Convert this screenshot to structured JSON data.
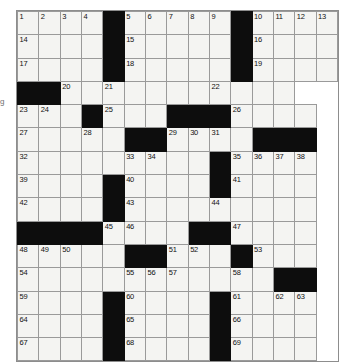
{
  "puzzle": {
    "title": "Crossword Grid",
    "rows": 14,
    "cols": 13,
    "cell_fill_color": "#f4f4f2",
    "block_color": "#0d0d0d",
    "grid_line_color": "#9a9a9a",
    "number_color": "#111111",
    "margin_artifact": "g",
    "grid": [
      [
        {
          "n": "1",
          "b": false
        },
        {
          "n": "2",
          "b": false
        },
        {
          "n": "3",
          "b": false
        },
        {
          "n": "4",
          "b": false
        },
        {
          "n": "",
          "b": true
        },
        {
          "n": "5",
          "b": false
        },
        {
          "n": "6",
          "b": false
        },
        {
          "n": "7",
          "b": false
        },
        {
          "n": "8",
          "b": false
        },
        {
          "n": "9",
          "b": false
        },
        {
          "n": "",
          "b": true
        },
        {
          "n": "10",
          "b": false
        },
        {
          "n": "11",
          "b": false
        },
        {
          "n": "12",
          "b": false
        },
        {
          "n": "13",
          "b": false
        }
      ],
      [
        {
          "n": "14",
          "b": false
        },
        {
          "n": "",
          "b": false
        },
        {
          "n": "",
          "b": false
        },
        {
          "n": "",
          "b": false
        },
        {
          "n": "",
          "b": true
        },
        {
          "n": "15",
          "b": false
        },
        {
          "n": "",
          "b": false
        },
        {
          "n": "",
          "b": false
        },
        {
          "n": "",
          "b": false
        },
        {
          "n": "",
          "b": false
        },
        {
          "n": "",
          "b": true
        },
        {
          "n": "16",
          "b": false
        },
        {
          "n": "",
          "b": false
        },
        {
          "n": "",
          "b": false
        },
        {
          "n": "",
          "b": false
        }
      ],
      [
        {
          "n": "17",
          "b": false
        },
        {
          "n": "",
          "b": false
        },
        {
          "n": "",
          "b": false
        },
        {
          "n": "",
          "b": false
        },
        {
          "n": "",
          "b": true
        },
        {
          "n": "18",
          "b": false
        },
        {
          "n": "",
          "b": false
        },
        {
          "n": "",
          "b": false
        },
        {
          "n": "",
          "b": false
        },
        {
          "n": "",
          "b": false
        },
        {
          "n": "",
          "b": true
        },
        {
          "n": "19",
          "b": false
        },
        {
          "n": "",
          "b": false
        },
        {
          "n": "",
          "b": false
        },
        {
          "n": "",
          "b": false
        }
      ],
      [
        {
          "n": "",
          "b": true
        },
        {
          "n": "",
          "b": true
        },
        {
          "n": "20",
          "b": false
        },
        {
          "n": "",
          "b": false
        },
        {
          "n": "21",
          "b": false
        },
        {
          "n": "",
          "b": false
        },
        {
          "n": "",
          "b": false
        },
        {
          "n": "",
          "b": false
        },
        {
          "n": "",
          "b": false
        },
        {
          "n": "22",
          "b": false
        },
        {
          "n": "",
          "b": false
        },
        {
          "n": "",
          "b": false
        },
        {
          "n": "",
          "b": false
        }
      ],
      [
        {
          "n": "23",
          "b": false
        },
        {
          "n": "24",
          "b": false
        },
        {
          "n": "",
          "b": false
        },
        {
          "n": "",
          "b": true
        },
        {
          "n": "25",
          "b": false
        },
        {
          "n": "",
          "b": false
        },
        {
          "n": "",
          "b": false
        },
        {
          "n": "",
          "b": true
        },
        {
          "n": "",
          "b": true
        },
        {
          "n": "",
          "b": true
        },
        {
          "n": "26",
          "b": false
        },
        {
          "n": "",
          "b": false
        },
        {
          "n": "",
          "b": false
        },
        {
          "n": "",
          "b": false
        }
      ],
      [
        {
          "n": "27",
          "b": false
        },
        {
          "n": "",
          "b": false
        },
        {
          "n": "",
          "b": false
        },
        {
          "n": "28",
          "b": false
        },
        {
          "n": "",
          "b": false
        },
        {
          "n": "",
          "b": true
        },
        {
          "n": "",
          "b": true
        },
        {
          "n": "29",
          "b": false
        },
        {
          "n": "30",
          "b": false
        },
        {
          "n": "31",
          "b": false
        },
        {
          "n": "",
          "b": false
        },
        {
          "n": "",
          "b": true
        },
        {
          "n": "",
          "b": true
        },
        {
          "n": "",
          "b": true
        }
      ],
      [
        {
          "n": "32",
          "b": false
        },
        {
          "n": "",
          "b": false
        },
        {
          "n": "",
          "b": false
        },
        {
          "n": "",
          "b": false
        },
        {
          "n": "",
          "b": false
        },
        {
          "n": "33",
          "b": false
        },
        {
          "n": "34",
          "b": false
        },
        {
          "n": "",
          "b": false
        },
        {
          "n": "",
          "b": false
        },
        {
          "n": "",
          "b": true
        },
        {
          "n": "35",
          "b": false
        },
        {
          "n": "36",
          "b": false
        },
        {
          "n": "37",
          "b": false
        },
        {
          "n": "38",
          "b": false
        }
      ],
      [
        {
          "n": "39",
          "b": false
        },
        {
          "n": "",
          "b": false
        },
        {
          "n": "",
          "b": false
        },
        {
          "n": "",
          "b": false
        },
        {
          "n": "",
          "b": true
        },
        {
          "n": "40",
          "b": false
        },
        {
          "n": "",
          "b": false
        },
        {
          "n": "",
          "b": false
        },
        {
          "n": "",
          "b": false
        },
        {
          "n": "",
          "b": true
        },
        {
          "n": "41",
          "b": false
        },
        {
          "n": "",
          "b": false
        },
        {
          "n": "",
          "b": false
        },
        {
          "n": "",
          "b": false
        }
      ],
      [
        {
          "n": "42",
          "b": false
        },
        {
          "n": "",
          "b": false
        },
        {
          "n": "",
          "b": false
        },
        {
          "n": "",
          "b": false
        },
        {
          "n": "",
          "b": true
        },
        {
          "n": "43",
          "b": false
        },
        {
          "n": "",
          "b": false
        },
        {
          "n": "",
          "b": false
        },
        {
          "n": "",
          "b": false
        },
        {
          "n": "44",
          "b": false
        },
        {
          "n": "",
          "b": false
        },
        {
          "n": "",
          "b": false
        },
        {
          "n": "",
          "b": false
        },
        {
          "n": "",
          "b": false
        }
      ],
      [
        {
          "n": "",
          "b": true
        },
        {
          "n": "",
          "b": true
        },
        {
          "n": "",
          "b": true
        },
        {
          "n": "",
          "b": true
        },
        {
          "n": "45",
          "b": false
        },
        {
          "n": "46",
          "b": false
        },
        {
          "n": "",
          "b": false
        },
        {
          "n": "",
          "b": false
        },
        {
          "n": "",
          "b": true
        },
        {
          "n": "",
          "b": true
        },
        {
          "n": "47",
          "b": false
        },
        {
          "n": "",
          "b": false
        },
        {
          "n": "",
          "b": false
        },
        {
          "n": "",
          "b": false
        }
      ],
      [
        {
          "n": "48",
          "b": false
        },
        {
          "n": "49",
          "b": false
        },
        {
          "n": "50",
          "b": false
        },
        {
          "n": "",
          "b": false
        },
        {
          "n": "",
          "b": false
        },
        {
          "n": "",
          "b": true
        },
        {
          "n": "",
          "b": true
        },
        {
          "n": "51",
          "b": false
        },
        {
          "n": "52",
          "b": false
        },
        {
          "n": "",
          "b": false
        },
        {
          "n": "",
          "b": true
        },
        {
          "n": "53",
          "b": false
        },
        {
          "n": "",
          "b": false
        },
        {
          "n": "",
          "b": false
        }
      ],
      [
        {
          "n": "54",
          "b": false
        },
        {
          "n": "",
          "b": false
        },
        {
          "n": "",
          "b": false
        },
        {
          "n": "",
          "b": false
        },
        {
          "n": "",
          "b": false
        },
        {
          "n": "55",
          "b": false
        },
        {
          "n": "56",
          "b": false
        },
        {
          "n": "57",
          "b": false
        },
        {
          "n": "",
          "b": false
        },
        {
          "n": "",
          "b": false
        },
        {
          "n": "58",
          "b": false
        },
        {
          "n": "",
          "b": false
        },
        {
          "n": "",
          "b": true
        },
        {
          "n": "",
          "b": true
        }
      ],
      [
        {
          "n": "59",
          "b": false
        },
        {
          "n": "",
          "b": false
        },
        {
          "n": "",
          "b": false
        },
        {
          "n": "",
          "b": false
        },
        {
          "n": "",
          "b": true
        },
        {
          "n": "60",
          "b": false
        },
        {
          "n": "",
          "b": false
        },
        {
          "n": "",
          "b": false
        },
        {
          "n": "",
          "b": false
        },
        {
          "n": "",
          "b": true
        },
        {
          "n": "61",
          "b": false
        },
        {
          "n": "",
          "b": false
        },
        {
          "n": "62",
          "b": false
        },
        {
          "n": "63",
          "b": false
        }
      ],
      [
        {
          "n": "64",
          "b": false
        },
        {
          "n": "",
          "b": false
        },
        {
          "n": "",
          "b": false
        },
        {
          "n": "",
          "b": false
        },
        {
          "n": "",
          "b": true
        },
        {
          "n": "65",
          "b": false
        },
        {
          "n": "",
          "b": false
        },
        {
          "n": "",
          "b": false
        },
        {
          "n": "",
          "b": false
        },
        {
          "n": "",
          "b": true
        },
        {
          "n": "66",
          "b": false
        },
        {
          "n": "",
          "b": false
        },
        {
          "n": "",
          "b": false
        },
        {
          "n": "",
          "b": false
        }
      ],
      [
        {
          "n": "67",
          "b": false
        },
        {
          "n": "",
          "b": false
        },
        {
          "n": "",
          "b": false
        },
        {
          "n": "",
          "b": false
        },
        {
          "n": "",
          "b": true
        },
        {
          "n": "68",
          "b": false
        },
        {
          "n": "",
          "b": false
        },
        {
          "n": "",
          "b": false
        },
        {
          "n": "",
          "b": false
        },
        {
          "n": "",
          "b": true
        },
        {
          "n": "69",
          "b": false
        },
        {
          "n": "",
          "b": false
        },
        {
          "n": "",
          "b": false
        },
        {
          "n": "",
          "b": false
        }
      ]
    ]
  }
}
